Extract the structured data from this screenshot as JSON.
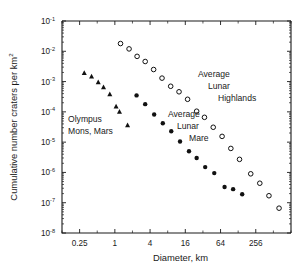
{
  "chart_data": {
    "type": "scatter",
    "title": "",
    "xlabel": "Diameter, km",
    "ylabel": "Cumulative number craters per km",
    "ylabel_superscript": "2",
    "xscale": "log",
    "yscale": "log",
    "xlim": [
      0.125,
      1024
    ],
    "ylim": [
      1e-08,
      0.1
    ],
    "grid": false,
    "legend": "annotations",
    "xticks": [
      0.25,
      1,
      4,
      16,
      64,
      256
    ],
    "xtick_labels": [
      "0.25",
      "1",
      "4",
      "16",
      "64",
      "256"
    ],
    "yticks": [
      0.1,
      0.01,
      0.001,
      0.0001,
      1e-05,
      1e-06,
      1e-07,
      1e-08
    ],
    "ytick_labels": [
      "10",
      "10",
      "10",
      "10",
      "10",
      "10",
      "10",
      "10"
    ],
    "ytick_exponents": [
      "-1",
      "-2",
      "-3",
      "-4",
      "-5",
      "-6",
      "-7",
      "-8"
    ],
    "series": [
      {
        "name": "Average Lunar Highlands",
        "marker": "open-circle",
        "color": "#111111",
        "points": [
          {
            "x": 1.25,
            "y": 0.018
          },
          {
            "x": 1.75,
            "y": 0.012
          },
          {
            "x": 2.4,
            "y": 0.0068
          },
          {
            "x": 3.3,
            "y": 0.0046
          },
          {
            "x": 4.6,
            "y": 0.0025
          },
          {
            "x": 6.4,
            "y": 0.0013
          },
          {
            "x": 9.0,
            "y": 0.0007
          },
          {
            "x": 12.5,
            "y": 0.00046
          },
          {
            "x": 17.5,
            "y": 0.00026
          },
          {
            "x": 25.0,
            "y": 0.000105
          },
          {
            "x": 34.0,
            "y": 6.6e-05
          },
          {
            "x": 48.0,
            "y": 3.1e-05
          },
          {
            "x": 68.0,
            "y": 1.55e-05
          },
          {
            "x": 96.0,
            "y": 6.2e-06
          },
          {
            "x": 135.0,
            "y": 2.7e-06
          },
          {
            "x": 210.0,
            "y": 9e-07
          },
          {
            "x": 300.0,
            "y": 4.4e-07
          },
          {
            "x": 430.0,
            "y": 1.7e-07
          },
          {
            "x": 640.0,
            "y": 6.6e-08
          }
        ]
      },
      {
        "name": "Average Lunar Mare",
        "marker": "filled-circle",
        "color": "#111111",
        "points": [
          {
            "x": 2.35,
            "y": 0.00035
          },
          {
            "x": 3.3,
            "y": 0.00018
          },
          {
            "x": 4.7,
            "y": 8.2e-05
          },
          {
            "x": 6.6,
            "y": 4.2e-05
          },
          {
            "x": 9.2,
            "y": 2.3e-05
          },
          {
            "x": 13.0,
            "y": 1.05e-05
          },
          {
            "x": 18.5,
            "y": 5e-06
          },
          {
            "x": 25.0,
            "y": 3e-06
          },
          {
            "x": 35.0,
            "y": 1.5e-06
          },
          {
            "x": 50.0,
            "y": 9.5e-07
          },
          {
            "x": 75.0,
            "y": 3.3e-07
          },
          {
            "x": 105.0,
            "y": 2.8e-07
          },
          {
            "x": 150.0,
            "y": 1.9e-07
          }
        ]
      },
      {
        "name": "Olympus Mons, Mars",
        "marker": "triangle",
        "color": "#111111",
        "points": [
          {
            "x": 0.3,
            "y": 0.0019
          },
          {
            "x": 0.4,
            "y": 0.00145
          },
          {
            "x": 0.52,
            "y": 0.00095
          },
          {
            "x": 0.64,
            "y": 0.00064
          },
          {
            "x": 0.82,
            "y": 0.00038
          },
          {
            "x": 1.05,
            "y": 0.00015
          },
          {
            "x": 1.2,
            "y": 0.0001
          },
          {
            "x": 1.65,
            "y": 3.6e-05
          }
        ]
      }
    ],
    "annotations": [
      {
        "id": "highlands",
        "lines": [
          "Average",
          "Lunar",
          "Highlands"
        ]
      },
      {
        "id": "mare",
        "lines": [
          "Average",
          "Lunar",
          "Mare"
        ]
      },
      {
        "id": "olympus",
        "lines": [
          "Olympus",
          "Mons, Mars"
        ]
      }
    ]
  }
}
